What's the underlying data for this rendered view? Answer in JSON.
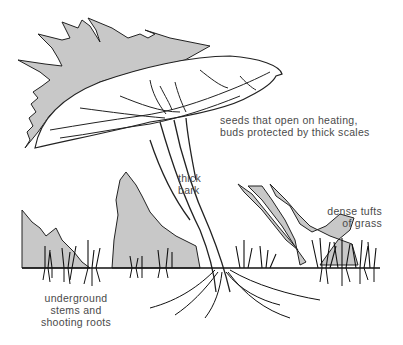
{
  "diagram": {
    "colors": {
      "flame_fill": "#c8c8c8",
      "ink": "#1a1a1a",
      "label_text": "#4a4a4a",
      "background": "#ffffff"
    },
    "labels": [
      {
        "id": "seeds",
        "lines": [
          "seeds that open on heating,",
          "buds protected by thick scales"
        ]
      },
      {
        "id": "bark",
        "lines": [
          "thick",
          "bark"
        ]
      },
      {
        "id": "grass",
        "lines": [
          "dense tufts",
          "of grass"
        ]
      },
      {
        "id": "underground",
        "lines": [
          "underground",
          "stems and",
          "shooting roots"
        ]
      }
    ]
  }
}
